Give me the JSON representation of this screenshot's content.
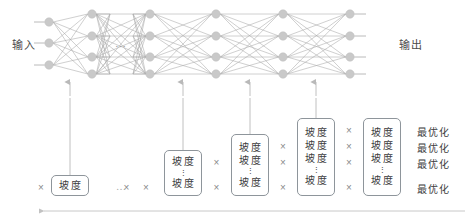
{
  "diagram": {
    "title_labels": {
      "input": "输入",
      "output": "输出",
      "top_ellipsis": "…"
    },
    "colors": {
      "node_fill": "#c9c9c9",
      "edge": "#9a9a9a",
      "arrow": "#b9b9b9",
      "box_border": "#8e959b",
      "text": "#3d3d3d",
      "muted_text": "#8a8a8a",
      "background": "#ffffff"
    },
    "network": {
      "layers": [
        {
          "name": "input-layer",
          "x": 49,
          "nodes": 3
        },
        {
          "name": "hidden-layer-1",
          "x": 92,
          "nodes": 4
        },
        {
          "name": "hidden-layer-2",
          "x": 150,
          "nodes": 4
        },
        {
          "name": "hidden-layer-3",
          "x": 216,
          "nodes": 4
        },
        {
          "name": "hidden-layer-4",
          "x": 283,
          "nodes": 4
        },
        {
          "name": "output-layer",
          "x": 350,
          "nodes": 4
        }
      ],
      "up_arrows_x": [
        70,
        183,
        250,
        316
      ]
    },
    "formula": {
      "gradient_label": "坡度",
      "times_symbol": "×",
      "ellipsis": "…",
      "vertical_dots": "⋮",
      "optimize_label": "最优化",
      "columns": [
        {
          "name": "column-1",
          "x": 70,
          "rows": [
            "坡度"
          ],
          "dots_after_index": -1
        },
        {
          "name": "column-2",
          "x": 183,
          "rows": [
            "坡度",
            "坡度"
          ],
          "dots_after_index": 0
        },
        {
          "name": "column-3",
          "x": 250,
          "rows": [
            "坡度",
            "坡度",
            "坡度"
          ],
          "dots_after_index": 1
        },
        {
          "name": "column-4",
          "x": 316,
          "rows": [
            "坡度",
            "坡度",
            "坡度",
            "坡度"
          ],
          "dots_after_index": 2
        },
        {
          "name": "column-5",
          "x": 382,
          "rows": [
            "坡度",
            "坡度",
            "坡度",
            "坡度"
          ],
          "dots_after_index": 2
        }
      ],
      "optimize_rows": [
        "最优化",
        "最优化",
        "最优化",
        "最优化"
      ]
    },
    "bottom_axis": {
      "name": "backprop-direction-arrow",
      "direction": "left"
    }
  }
}
